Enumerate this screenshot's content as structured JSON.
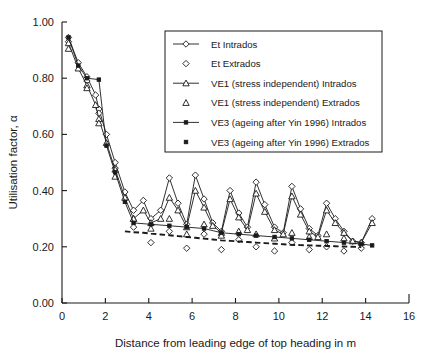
{
  "chart_data": {
    "type": "line",
    "title": "",
    "xlabel": "Distance from leading edge of top heading in m",
    "ylabel": "Utilisation factor, α",
    "xlim": [
      0,
      16
    ],
    "ylim": [
      0,
      1.0
    ],
    "xticks": [
      0,
      2,
      4,
      6,
      8,
      10,
      12,
      14,
      16
    ],
    "xticklabels": [
      "0",
      "2",
      "4",
      "6",
      "8",
      "10",
      "12",
      "14",
      "16"
    ],
    "yticks": [
      0.0,
      0.2,
      0.4,
      0.6,
      0.8,
      1.0
    ],
    "yticklabels": [
      "0.00",
      "0.20",
      "0.40",
      "0.60",
      "0.80",
      "1.00"
    ],
    "grid": false,
    "legend_position": "upper right",
    "series": [
      {
        "name": "Et Intrados",
        "marker": "diamond-open",
        "line": "solid",
        "x": [
          0.3,
          0.75,
          1.15,
          1.55,
          1.7,
          2.05,
          2.45,
          2.9,
          3.3,
          3.75,
          4.1,
          4.55,
          4.95,
          5.35,
          5.75,
          6.15,
          6.55,
          6.95,
          7.35,
          7.75,
          8.15,
          8.55,
          8.95,
          9.35,
          9.8,
          10.2,
          10.6,
          11.0,
          11.4,
          11.8,
          12.2,
          12.6,
          13.0,
          13.4,
          13.8,
          14.3
        ],
        "y": [
          0.945,
          0.855,
          0.805,
          0.74,
          0.69,
          0.6,
          0.5,
          0.395,
          0.33,
          0.365,
          0.3,
          0.33,
          0.445,
          0.355,
          0.28,
          0.455,
          0.37,
          0.285,
          0.255,
          0.4,
          0.32,
          0.27,
          0.43,
          0.35,
          0.27,
          0.25,
          0.415,
          0.335,
          0.265,
          0.24,
          0.355,
          0.3,
          0.255,
          0.22,
          0.215,
          0.3
        ]
      },
      {
        "name": "Et Extrados",
        "marker": "diamond-open",
        "line": "none",
        "x": [
          0.3,
          1.15,
          1.7,
          2.45,
          3.3,
          4.1,
          4.95,
          5.75,
          6.55,
          7.35,
          8.15,
          8.95,
          9.8,
          10.6,
          11.4,
          12.2,
          13.0,
          13.8
        ],
        "y": [
          0.93,
          0.79,
          0.675,
          0.48,
          0.27,
          0.215,
          0.255,
          0.195,
          0.245,
          0.19,
          0.225,
          0.2,
          0.185,
          0.215,
          0.19,
          0.2,
          0.185,
          0.195
        ]
      },
      {
        "name": "VE1 (stress independent) Intrados",
        "marker": "triangle-open",
        "line": "solid",
        "x": [
          0.3,
          0.75,
          1.15,
          1.55,
          1.7,
          2.05,
          2.45,
          2.9,
          3.3,
          3.75,
          4.1,
          4.55,
          4.95,
          5.35,
          5.75,
          6.15,
          6.55,
          6.95,
          7.35,
          7.75,
          8.15,
          8.55,
          8.95,
          9.35,
          9.8,
          10.2,
          10.6,
          11.0,
          11.4,
          11.8,
          12.2,
          12.6,
          13.0,
          13.4,
          13.8,
          14.3
        ],
        "y": [
          0.925,
          0.835,
          0.775,
          0.705,
          0.655,
          0.57,
          0.475,
          0.375,
          0.3,
          0.33,
          0.285,
          0.3,
          0.375,
          0.33,
          0.27,
          0.4,
          0.34,
          0.275,
          0.25,
          0.37,
          0.305,
          0.26,
          0.39,
          0.325,
          0.26,
          0.245,
          0.38,
          0.315,
          0.255,
          0.235,
          0.33,
          0.285,
          0.25,
          0.22,
          0.215,
          0.285
        ]
      },
      {
        "name": "VE1 (stress independent) Extrados",
        "marker": "triangle-open",
        "line": "none",
        "x": [
          0.3,
          1.15,
          1.7,
          2.45,
          3.3,
          4.1,
          4.95,
          5.75,
          6.55,
          7.35,
          8.15,
          8.95,
          9.8,
          10.6,
          11.4,
          12.2,
          13.0
        ],
        "y": [
          0.905,
          0.765,
          0.64,
          0.45,
          0.3,
          0.265,
          0.3,
          0.245,
          0.28,
          0.24,
          0.255,
          0.245,
          0.23,
          0.25,
          0.235,
          0.245,
          0.23
        ]
      },
      {
        "name": "VE3 (ageing after Yin 1996) Intrados",
        "marker": "square-filled",
        "line": "solid",
        "x": [
          0.3,
          0.75,
          1.15,
          1.7,
          2.05,
          2.45,
          2.9,
          3.3,
          4.1,
          4.95,
          5.75,
          6.55,
          7.35,
          8.15,
          8.95,
          9.8,
          10.6,
          11.4,
          12.2,
          13.0,
          13.8,
          14.3
        ],
        "y": [
          0.945,
          0.845,
          0.8,
          0.795,
          0.56,
          0.465,
          0.36,
          0.285,
          0.28,
          0.275,
          0.27,
          0.265,
          0.25,
          0.245,
          0.24,
          0.235,
          0.23,
          0.225,
          0.22,
          0.215,
          0.21,
          0.205
        ]
      },
      {
        "name": "VE3 (ageing after Yin 1996) Extrados",
        "marker": "square-filled",
        "line": "dashed",
        "x": [
          2.9,
          3.3,
          3.75,
          4.1,
          4.55,
          4.95,
          5.35,
          5.75,
          6.15,
          6.55,
          6.95,
          7.35,
          7.75,
          8.15,
          8.55,
          8.95,
          9.35,
          9.8,
          10.2,
          10.6,
          11.0,
          11.4,
          11.8,
          12.2,
          12.6,
          13.0,
          13.4,
          13.8
        ],
        "y": [
          0.255,
          0.252,
          0.25,
          0.247,
          0.244,
          0.241,
          0.238,
          0.235,
          0.232,
          0.229,
          0.226,
          0.223,
          0.221,
          0.219,
          0.217,
          0.215,
          0.213,
          0.211,
          0.209,
          0.207,
          0.206,
          0.205,
          0.204,
          0.203,
          0.202,
          0.201,
          0.2,
          0.199
        ]
      }
    ]
  },
  "legend": {
    "entries": [
      {
        "label": "Et Intrados",
        "marker": "diamond-open",
        "line": "solid"
      },
      {
        "label": "Et Extrados",
        "marker": "diamond-open",
        "line": "none"
      },
      {
        "label": "VE1 (stress independent) Intrados",
        "marker": "triangle-open",
        "line": "solid"
      },
      {
        "label": "VE1 (stress independent) Extrados",
        "marker": "triangle-open",
        "line": "none"
      },
      {
        "label": "VE3 (ageing after Yin 1996) Intrados",
        "marker": "square-filled",
        "line": "solid"
      },
      {
        "label": "VE3 (ageing after Yin 1996) Extrados",
        "marker": "square-filled",
        "line": "none"
      }
    ]
  },
  "colors": {
    "ink": "#1a1a1a",
    "background": "#ffffff"
  }
}
